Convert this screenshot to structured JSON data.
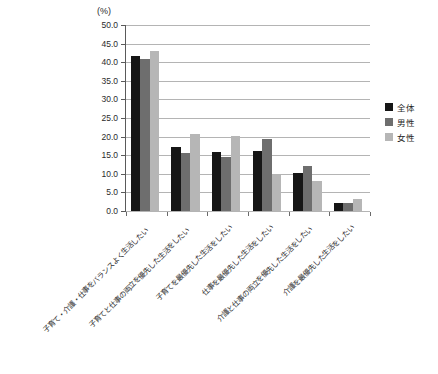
{
  "chart_data": {
    "type": "bar",
    "title": "",
    "subtitle": "",
    "xlabel": "",
    "ylabel": "",
    "unit_label": "(%)",
    "ylim": [
      0.0,
      50.0
    ],
    "ytick_step": 5.0,
    "ytick_labels": [
      "50.0",
      "45.0",
      "40.0",
      "35.0",
      "30.0",
      "25.0",
      "20.0",
      "15.0",
      "10.0",
      "5.0",
      "0.0"
    ],
    "ytick_values": [
      50.0,
      45.0,
      40.0,
      35.0,
      30.0,
      25.0,
      20.0,
      15.0,
      10.0,
      5.0,
      0.0
    ],
    "grid": true,
    "grid_axis": "y",
    "legend_position": "right",
    "categories": [
      "子育て・介護・仕事をバランスよく生活したい",
      "子育てと仕事の両立を優先した生活をしたい",
      "子育てを最優先した生活をしたい",
      "仕事を最優先した生活をしたい",
      "介護と仕事の両立を優先した生活をしたい",
      "介護を最優先した生活をしたい"
    ],
    "series": [
      {
        "name": "全体",
        "color": "#161616",
        "values": [
          41.6,
          17.2,
          15.9,
          16.1,
          10.3,
          2.2
        ]
      },
      {
        "name": "男性",
        "color": "#6e6e6e",
        "values": [
          40.8,
          15.5,
          14.6,
          19.3,
          12.0,
          2.2
        ]
      },
      {
        "name": "女性",
        "color": "#b6b6b6",
        "values": [
          43.0,
          20.6,
          20.1,
          9.8,
          8.2,
          3.2
        ]
      }
    ]
  }
}
